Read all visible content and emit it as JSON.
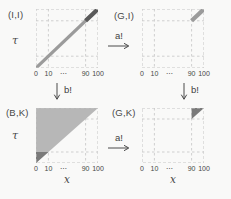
{
  "figure": {
    "panels": {
      "top_left": {
        "label": "(I,I)",
        "y_axis": "τ",
        "content": "identity diagonal line from (0,0) to (100,100); segment from 90 to 100 highlighted darker"
      },
      "top_right": {
        "label": "(G,I)",
        "content": "single diagonal segment from (90,90) to (100,100)"
      },
      "bottom_left": {
        "label": "(B,K)",
        "y_axis": "τ",
        "x_axis": "x",
        "content": "region above diagonal shaded light gray; dark triangle with vertices (0,0),(0,10),(10,10)"
      },
      "bottom_right": {
        "label": "(G,K)",
        "x_axis": "x",
        "content": "dark triangle with vertices (90,90),(90,100),(100,100)"
      }
    },
    "ticks": [
      "0",
      "10",
      "⋯",
      "90",
      "100"
    ],
    "arrows": {
      "a": "a!",
      "b": "b!"
    },
    "colors": {
      "background": "#f9f9f8",
      "grid": "#cfcfcf",
      "border": "#c4c4c4",
      "line_medium": "#9b9b9b",
      "line_dark": "#5a5a5a",
      "fill_light": "#b7b7b7",
      "fill_dark": "#7a7a7a",
      "text": "#3f3f3f"
    }
  }
}
